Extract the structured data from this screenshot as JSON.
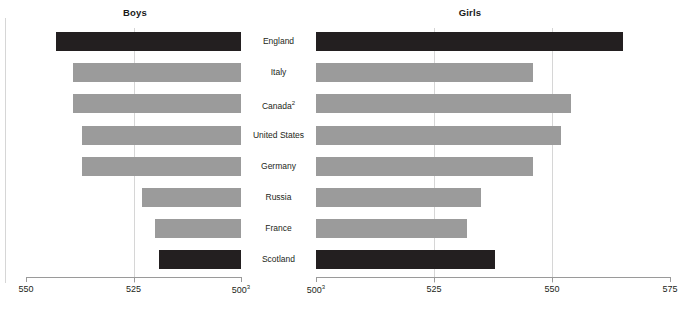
{
  "chart_data": {
    "type": "bar",
    "title": "",
    "orientation": "horizontal",
    "layout": "paired back-to-back panels sharing centered category labels",
    "grid": true,
    "legend": null,
    "categories": [
      "England",
      "Italy",
      "Canada",
      "United States",
      "Germany",
      "Russia",
      "France",
      "Scotland"
    ],
    "category_footnotes": {
      "Canada": "2"
    },
    "panels": [
      {
        "name": "boys",
        "label": "Boys",
        "xlabel": "",
        "ylabel": "",
        "axis_reversed": true,
        "xlim": [
          550,
          500
        ],
        "ticks": [
          550,
          525,
          500
        ],
        "tick_labels": [
          "550",
          "525",
          "500"
        ],
        "tick_footnotes": {
          "500": "3"
        },
        "values": [
          543,
          539,
          539,
          537,
          537,
          523,
          520,
          519
        ],
        "bar_colors": [
          "dark",
          "light",
          "light",
          "light",
          "light",
          "light",
          "light",
          "dark"
        ]
      },
      {
        "name": "girls",
        "label": "Girls",
        "xlabel": "",
        "ylabel": "",
        "axis_reversed": false,
        "xlim": [
          500,
          575
        ],
        "ticks": [
          500,
          525,
          550,
          575
        ],
        "tick_labels": [
          "500",
          "525",
          "550",
          "575"
        ],
        "tick_footnotes": {
          "500": "3"
        },
        "values": [
          565,
          546,
          554,
          552,
          546,
          535,
          532,
          538
        ],
        "bar_colors": [
          "dark",
          "light",
          "light",
          "light",
          "light",
          "light",
          "light",
          "dark"
        ]
      }
    ],
    "colors": {
      "dark_bar": "#231f20",
      "light_bar": "#9b9b9b",
      "gridline": "#d6d6d6",
      "axis": "#9a9a9a"
    }
  }
}
